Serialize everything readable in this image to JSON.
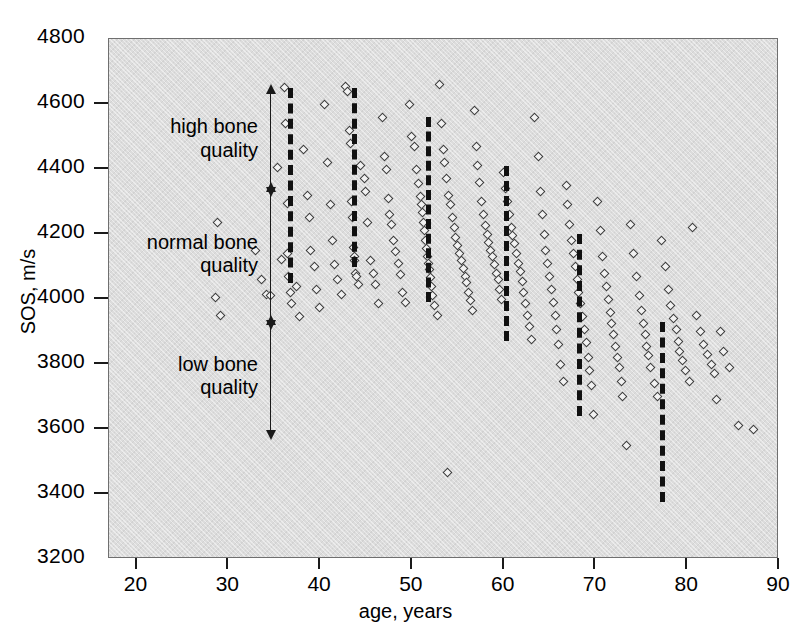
{
  "chart_data": {
    "type": "scatter",
    "title": "",
    "xlabel": "age, years",
    "ylabel": "SOS, m/s",
    "xlim": [
      17,
      90
    ],
    "ylim": [
      3200,
      4800
    ],
    "xticks": [
      20,
      30,
      40,
      50,
      60,
      70,
      80,
      90
    ],
    "yticks": [
      3200,
      3400,
      3600,
      3800,
      4000,
      4200,
      4400,
      4600,
      4800
    ],
    "grid": false,
    "legend": "none",
    "marker": "open-diamond",
    "background_color": "#dcdcdc",
    "marker_edge_color": "#3a3a3a",
    "marker_face_color": "#f2f2f2",
    "line_color": "#111111",
    "annotation_color": "#1a1a1a",
    "series": [
      {
        "name": "subjects",
        "points": [
          [
            28.8,
            4235
          ],
          [
            28.6,
            4005
          ],
          [
            29.2,
            3950
          ],
          [
            33.0,
            4150
          ],
          [
            33.6,
            4060
          ],
          [
            34.2,
            4015
          ],
          [
            34.6,
            4010
          ],
          [
            35.4,
            4405
          ],
          [
            35.8,
            4122
          ],
          [
            36.1,
            4650
          ],
          [
            36.2,
            4540
          ],
          [
            36.4,
            4295
          ],
          [
            36.5,
            4140
          ],
          [
            36.6,
            4070
          ],
          [
            36.8,
            4020
          ],
          [
            36.9,
            3985
          ],
          [
            37.4,
            4040
          ],
          [
            37.8,
            3945
          ],
          [
            38.2,
            4460
          ],
          [
            38.6,
            4320
          ],
          [
            38.8,
            4250
          ],
          [
            39.0,
            4150
          ],
          [
            39.4,
            4100
          ],
          [
            39.6,
            4030
          ],
          [
            39.9,
            3975
          ],
          [
            40.5,
            4600
          ],
          [
            40.8,
            4420
          ],
          [
            41.1,
            4290
          ],
          [
            41.4,
            4180
          ],
          [
            41.6,
            4105
          ],
          [
            41.9,
            4060
          ],
          [
            42.3,
            4015
          ],
          [
            42.8,
            4655
          ],
          [
            43.0,
            4640
          ],
          [
            43.2,
            4520
          ],
          [
            43.3,
            4480
          ],
          [
            43.4,
            4300
          ],
          [
            43.5,
            4250
          ],
          [
            43.6,
            4160
          ],
          [
            43.7,
            4130
          ],
          [
            43.8,
            4120
          ],
          [
            43.9,
            4080
          ],
          [
            44.0,
            4070
          ],
          [
            44.2,
            4045
          ],
          [
            44.4,
            4410
          ],
          [
            44.8,
            4370
          ],
          [
            45.0,
            4330
          ],
          [
            45.2,
            4235
          ],
          [
            45.5,
            4120
          ],
          [
            45.8,
            4080
          ],
          [
            46.0,
            4045
          ],
          [
            46.4,
            3985
          ],
          [
            46.8,
            4560
          ],
          [
            47.0,
            4440
          ],
          [
            47.2,
            4400
          ],
          [
            47.4,
            4310
          ],
          [
            47.6,
            4260
          ],
          [
            47.8,
            4230
          ],
          [
            48.0,
            4180
          ],
          [
            48.2,
            4145
          ],
          [
            48.5,
            4110
          ],
          [
            48.8,
            4075
          ],
          [
            49.0,
            4020
          ],
          [
            49.3,
            3990
          ],
          [
            49.7,
            4600
          ],
          [
            50.0,
            4500
          ],
          [
            50.3,
            4470
          ],
          [
            50.5,
            4400
          ],
          [
            50.7,
            4355
          ],
          [
            50.9,
            4315
          ],
          [
            51.0,
            4290
          ],
          [
            51.2,
            4265
          ],
          [
            51.3,
            4235
          ],
          [
            51.4,
            4210
          ],
          [
            51.5,
            4180
          ],
          [
            51.6,
            4155
          ],
          [
            51.7,
            4130
          ],
          [
            51.8,
            4110
          ],
          [
            51.9,
            4090
          ],
          [
            52.0,
            4065
          ],
          [
            52.1,
            4040
          ],
          [
            52.3,
            4010
          ],
          [
            52.5,
            3980
          ],
          [
            52.8,
            3950
          ],
          [
            53.0,
            4660
          ],
          [
            53.2,
            4540
          ],
          [
            53.4,
            4460
          ],
          [
            53.6,
            4420
          ],
          [
            53.8,
            4370
          ],
          [
            54.0,
            4320
          ],
          [
            54.2,
            4290
          ],
          [
            54.4,
            4250
          ],
          [
            54.6,
            4220
          ],
          [
            54.8,
            4190
          ],
          [
            55.0,
            4165
          ],
          [
            55.2,
            4140
          ],
          [
            55.4,
            4120
          ],
          [
            55.6,
            4095
          ],
          [
            55.8,
            4070
          ],
          [
            56.0,
            4050
          ],
          [
            56.2,
            4020
          ],
          [
            56.4,
            3995
          ],
          [
            56.6,
            3965
          ],
          [
            53.9,
            3465
          ],
          [
            56.8,
            4580
          ],
          [
            57.0,
            4470
          ],
          [
            57.2,
            4410
          ],
          [
            57.4,
            4360
          ],
          [
            57.6,
            4300
          ],
          [
            57.8,
            4260
          ],
          [
            58.0,
            4225
          ],
          [
            58.2,
            4200
          ],
          [
            58.4,
            4175
          ],
          [
            58.6,
            4150
          ],
          [
            58.8,
            4130
          ],
          [
            59.0,
            4105
          ],
          [
            59.2,
            4080
          ],
          [
            59.4,
            4060
          ],
          [
            59.6,
            4030
          ],
          [
            59.8,
            4000
          ],
          [
            60.0,
            4390
          ],
          [
            60.2,
            4340
          ],
          [
            60.4,
            4300
          ],
          [
            60.6,
            4260
          ],
          [
            60.8,
            4220
          ],
          [
            61.0,
            4195
          ],
          [
            61.2,
            4170
          ],
          [
            61.4,
            4140
          ],
          [
            61.6,
            4110
          ],
          [
            61.8,
            4085
          ],
          [
            62.0,
            4055
          ],
          [
            62.2,
            4020
          ],
          [
            62.4,
            3985
          ],
          [
            62.6,
            3950
          ],
          [
            62.8,
            3915
          ],
          [
            63.0,
            3875
          ],
          [
            63.4,
            4560
          ],
          [
            63.8,
            4440
          ],
          [
            64.0,
            4330
          ],
          [
            64.2,
            4260
          ],
          [
            64.4,
            4200
          ],
          [
            64.6,
            4150
          ],
          [
            64.8,
            4110
          ],
          [
            65.0,
            4070
          ],
          [
            65.2,
            4030
          ],
          [
            65.4,
            3990
          ],
          [
            65.6,
            3950
          ],
          [
            65.8,
            3905
          ],
          [
            66.0,
            3860
          ],
          [
            66.2,
            3800
          ],
          [
            66.5,
            3745
          ],
          [
            66.8,
            4350
          ],
          [
            67.0,
            4290
          ],
          [
            67.2,
            4230
          ],
          [
            67.4,
            4180
          ],
          [
            67.6,
            4140
          ],
          [
            67.8,
            4100
          ],
          [
            68.0,
            4060
          ],
          [
            68.2,
            4020
          ],
          [
            68.4,
            3985
          ],
          [
            68.6,
            3945
          ],
          [
            68.8,
            3905
          ],
          [
            69.0,
            3865
          ],
          [
            69.2,
            3820
          ],
          [
            69.4,
            3780
          ],
          [
            69.6,
            3735
          ],
          [
            69.8,
            3645
          ],
          [
            70.2,
            4300
          ],
          [
            70.5,
            4210
          ],
          [
            70.8,
            4130
          ],
          [
            71.0,
            4080
          ],
          [
            71.2,
            4040
          ],
          [
            71.4,
            4000
          ],
          [
            71.6,
            3960
          ],
          [
            71.8,
            3925
          ],
          [
            72.0,
            3890
          ],
          [
            72.2,
            3855
          ],
          [
            72.4,
            3820
          ],
          [
            72.6,
            3790
          ],
          [
            72.8,
            3745
          ],
          [
            73.0,
            3700
          ],
          [
            73.4,
            3550
          ],
          [
            73.8,
            4230
          ],
          [
            74.2,
            4140
          ],
          [
            74.5,
            4070
          ],
          [
            74.8,
            4010
          ],
          [
            75.0,
            3965
          ],
          [
            75.2,
            3925
          ],
          [
            75.4,
            3890
          ],
          [
            75.6,
            3855
          ],
          [
            75.8,
            3825
          ],
          [
            76.0,
            3790
          ],
          [
            76.4,
            3740
          ],
          [
            76.8,
            3700
          ],
          [
            77.2,
            4180
          ],
          [
            77.6,
            4100
          ],
          [
            78.0,
            4030
          ],
          [
            78.2,
            3980
          ],
          [
            78.5,
            3940
          ],
          [
            78.8,
            3905
          ],
          [
            79.0,
            3870
          ],
          [
            79.2,
            3840
          ],
          [
            79.5,
            3810
          ],
          [
            79.8,
            3780
          ],
          [
            80.2,
            3745
          ],
          [
            80.6,
            4220
          ],
          [
            81.0,
            3950
          ],
          [
            81.4,
            3900
          ],
          [
            81.8,
            3860
          ],
          [
            82.2,
            3830
          ],
          [
            82.6,
            3800
          ],
          [
            83.0,
            3770
          ],
          [
            83.6,
            3900
          ],
          [
            84.0,
            3840
          ],
          [
            84.6,
            3790
          ],
          [
            85.6,
            3610
          ],
          [
            87.2,
            3600
          ],
          [
            83.2,
            3690
          ]
        ]
      }
    ],
    "trend_lines": [
      {
        "name": "percentile-marker-1",
        "age": 36.5,
        "y_top": 4650,
        "y_bottom": 4050
      },
      {
        "name": "percentile-marker-2",
        "age": 43.5,
        "y_top": 4650,
        "y_bottom": 4100
      },
      {
        "name": "percentile-marker-3",
        "age": 51.5,
        "y_top": 4560,
        "y_bottom": 3990
      },
      {
        "name": "percentile-marker-4",
        "age": 60.0,
        "y_top": 4410,
        "y_bottom": 3870
      },
      {
        "name": "percentile-marker-5",
        "age": 68.0,
        "y_top": 4200,
        "y_bottom": 3640
      },
      {
        "name": "percentile-marker-6",
        "age": 77.0,
        "y_top": 3930,
        "y_bottom": 3375
      }
    ],
    "annotations": [
      {
        "name": "high-bone-quality",
        "line1": "high bone",
        "line2": "quality",
        "y_top": 4630,
        "y_bottom": 4340
      },
      {
        "name": "normal-bone-quality",
        "line1": "normal bone",
        "line2": "quality",
        "y_top": 4330,
        "y_bottom": 3930
      },
      {
        "name": "low-bone-quality",
        "line1": "low bone",
        "line2": "quality",
        "y_top": 3920,
        "y_bottom": 3590
      }
    ]
  }
}
